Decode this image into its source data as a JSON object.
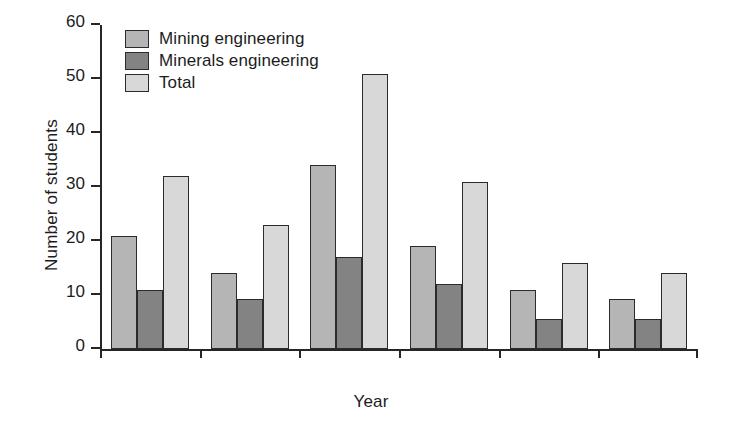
{
  "chart_data": {
    "type": "bar",
    "title": "",
    "xlabel": "Year",
    "ylabel": "Number of students",
    "categories": [
      "1990",
      "1991",
      "1992",
      "1993",
      "1994",
      "1995"
    ],
    "series": [
      {
        "name": "Mining engineering",
        "color": "#b5b5b5",
        "values": [
          21,
          14,
          34,
          19,
          11,
          9.2
        ]
      },
      {
        "name": "Minerals engineering",
        "color": "#838383",
        "values": [
          11,
          9.3,
          17,
          12,
          5.5,
          5.5
        ]
      },
      {
        "name": "Total",
        "color": "#d8d8d8",
        "values": [
          32,
          23,
          51,
          31,
          16,
          14
        ]
      }
    ],
    "ylim": [
      0,
      60
    ],
    "yticks": [
      0,
      10,
      20,
      30,
      40,
      50,
      60
    ],
    "ytick_labels": [
      "0",
      "10",
      "20",
      "30",
      "40",
      "50",
      "60"
    ],
    "grid": false,
    "legend_position": "top-left"
  },
  "legend": {
    "items": [
      {
        "label": "Mining engineering"
      },
      {
        "label": "Minerals engineering"
      },
      {
        "label": "Total"
      }
    ]
  },
  "axes": {
    "y_title": "Number of students",
    "x_title": "Year"
  }
}
